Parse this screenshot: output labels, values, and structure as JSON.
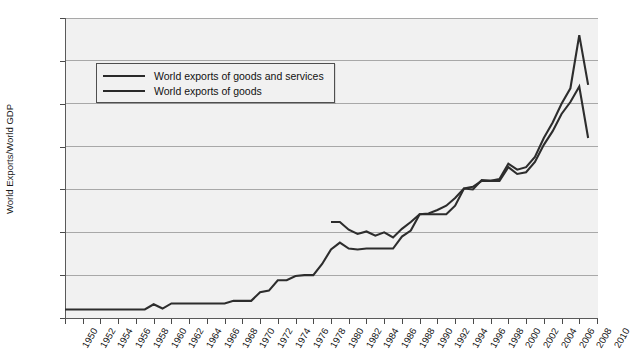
{
  "chart_data": {
    "type": "line",
    "title": "",
    "xlabel": "",
    "ylabel": "World Exports/World GDP",
    "xlim": [
      1950,
      2010
    ],
    "ylim": [
      0.0,
      0.35
    ],
    "grid": true,
    "legend_position": "upper-left-inside",
    "x_tick_labels": [
      "1950",
      "1952",
      "1954",
      "1956",
      "1958",
      "1960",
      "1962",
      "1964",
      "1966",
      "1968",
      "1970",
      "1972",
      "1974",
      "1976",
      "1978",
      "1980",
      "1982",
      "1984",
      "1986",
      "1988",
      "1990",
      "1992",
      "1994",
      "1996",
      "1998",
      "2000",
      "2002",
      "2004",
      "2006",
      "2008",
      "2010"
    ],
    "y_tick_labels": [
      "0.000",
      "0.050",
      "0.100",
      "0.150",
      "0.200",
      "0.250",
      "0.300",
      "0.350"
    ],
    "y_tick_values": [
      0.0,
      0.05,
      0.1,
      0.15,
      0.2,
      0.25,
      0.3,
      0.35
    ],
    "series": [
      {
        "name": "World exports of goods and services",
        "color": "#2d2d2d",
        "x": [
          1980,
          1981,
          1982,
          1983,
          1984,
          1985,
          1986,
          1987,
          1988,
          1989,
          1990,
          1991,
          1992,
          1993,
          1994,
          1995,
          1996,
          1997,
          1998,
          1999,
          2000,
          2001,
          2002,
          2003,
          2004,
          2005,
          2006,
          2007,
          2008,
          2009
        ],
        "values": [
          0.112,
          0.112,
          0.103,
          0.098,
          0.101,
          0.096,
          0.1,
          0.094,
          0.104,
          0.112,
          0.121,
          0.122,
          0.126,
          0.131,
          0.14,
          0.151,
          0.153,
          0.16,
          0.16,
          0.162,
          0.18,
          0.173,
          0.176,
          0.188,
          0.21,
          0.228,
          0.25,
          0.268,
          0.33,
          0.272
        ]
      },
      {
        "name": "World exports of goods",
        "color": "#2d2d2d",
        "x": [
          1950,
          1951,
          1952,
          1953,
          1954,
          1955,
          1956,
          1957,
          1958,
          1959,
          1960,
          1961,
          1962,
          1963,
          1964,
          1965,
          1966,
          1967,
          1968,
          1969,
          1970,
          1971,
          1972,
          1973,
          1974,
          1975,
          1976,
          1977,
          1978,
          1979,
          1980,
          1981,
          1982,
          1983,
          1984,
          1985,
          1986,
          1987,
          1988,
          1989,
          1990,
          1991,
          1992,
          1993,
          1994,
          1995,
          1996,
          1997,
          1998,
          1999,
          2000,
          2001,
          2002,
          2003,
          2004,
          2005,
          2006,
          2007,
          2008,
          2009
        ],
        "values": [
          0.01,
          0.01,
          0.01,
          0.01,
          0.01,
          0.01,
          0.01,
          0.01,
          0.01,
          0.01,
          0.016,
          0.011,
          0.017,
          0.017,
          0.017,
          0.017,
          0.017,
          0.017,
          0.017,
          0.02,
          0.02,
          0.02,
          0.03,
          0.032,
          0.044,
          0.044,
          0.049,
          0.05,
          0.05,
          0.063,
          0.08,
          0.088,
          0.081,
          0.08,
          0.081,
          0.081,
          0.081,
          0.081,
          0.095,
          0.102,
          0.121,
          0.121,
          0.121,
          0.121,
          0.131,
          0.151,
          0.15,
          0.161,
          0.16,
          0.16,
          0.176,
          0.168,
          0.17,
          0.182,
          0.202,
          0.218,
          0.238,
          0.252,
          0.27,
          0.21
        ]
      }
    ],
    "legend": [
      {
        "label": "World exports of goods and services"
      },
      {
        "label": "World exports of goods"
      }
    ],
    "axes_geometry": {
      "plot_left": 65,
      "plot_top": 18,
      "plot_width": 532,
      "plot_height": 300
    }
  }
}
